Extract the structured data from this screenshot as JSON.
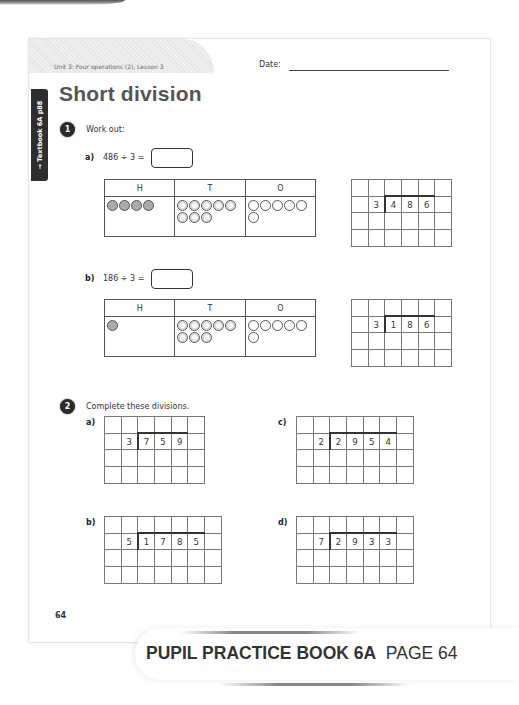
{
  "header": {
    "unit_label": "Unit 3: Four operations (2), Lesson 3",
    "date_label": "Date:"
  },
  "side_tab": {
    "label": "→ Textbook 6A p88"
  },
  "title": "Short division",
  "question1": {
    "number": "1",
    "instruction": "Work out:",
    "parts": [
      {
        "label": "a)",
        "expression": "486 ÷ 3 =",
        "answer": "",
        "place_value_headers": [
          "H",
          "T",
          "O"
        ],
        "counters": {
          "hundreds": 4,
          "tens": 8,
          "ones": 6
        },
        "grid": {
          "cols": 6,
          "rows": 4,
          "divisor": "3",
          "dividend": [
            "4",
            "8",
            "6"
          ]
        }
      },
      {
        "label": "b)",
        "expression": "186 ÷ 3 =",
        "answer": "",
        "place_value_headers": [
          "H",
          "T",
          "O"
        ],
        "counters": {
          "hundreds": 1,
          "tens": 8,
          "ones": 6
        },
        "grid": {
          "cols": 6,
          "rows": 4,
          "divisor": "3",
          "dividend": [
            "1",
            "8",
            "6"
          ]
        }
      }
    ]
  },
  "question2": {
    "number": "2",
    "instruction": "Complete these divisions.",
    "parts": [
      {
        "label": "a)",
        "grid": {
          "cols": 6,
          "rows": 4,
          "divisor": "3",
          "dividend": [
            "7",
            "5",
            "9"
          ]
        }
      },
      {
        "label": "b)",
        "grid": {
          "cols": 7,
          "rows": 4,
          "divisor": "5",
          "dividend": [
            "1",
            "7",
            "8",
            "5"
          ]
        }
      },
      {
        "label": "c)",
        "grid": {
          "cols": 7,
          "rows": 4,
          "divisor": "2",
          "dividend": [
            "2",
            "9",
            "5",
            "4"
          ]
        }
      },
      {
        "label": "d)",
        "grid": {
          "cols": 7,
          "rows": 4,
          "divisor": "7",
          "dividend": [
            "2",
            "9",
            "3",
            "3"
          ]
        }
      }
    ]
  },
  "page_number": "64",
  "banner": {
    "bold": "PUPIL PRACTICE BOOK 6A",
    "regular": "PAGE 64"
  }
}
